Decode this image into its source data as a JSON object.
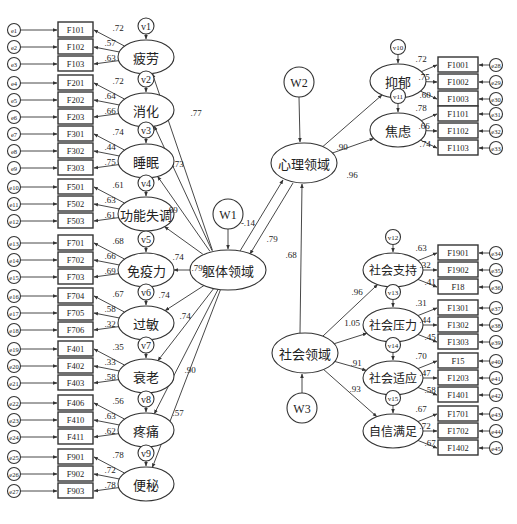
{
  "diagram": {
    "type": "structural-equation-model",
    "higher_order_factors": [
      {
        "id": "body",
        "label": "躯体领域",
        "disturbance": "W1"
      },
      {
        "id": "psych",
        "label": "心理领域",
        "disturbance": "W2"
      },
      {
        "id": "social",
        "label": "社会领域",
        "disturbance": "W3"
      }
    ],
    "structural_paths": [
      {
        "from": "body",
        "to": "psych",
        "value": "-.14"
      },
      {
        "from": "psych",
        "to": "body",
        "value": ".79"
      },
      {
        "from": "social",
        "to": "psych",
        "value": ".68"
      }
    ],
    "body_factors": [
      {
        "label": "疲劳",
        "disturbance": "v1",
        "loading": ".77",
        "items": [
          {
            "box": "F101",
            "err": "e1",
            "w": ".72"
          },
          {
            "box": "F102",
            "err": "e2",
            "w": ".57"
          },
          {
            "box": "F103",
            "err": "e3",
            "w": ".63"
          }
        ]
      },
      {
        "label": "消化",
        "disturbance": "v2",
        "loading": ".73",
        "items": [
          {
            "box": "F201",
            "err": "e4",
            "w": ".72"
          },
          {
            "box": "F202",
            "err": "e5",
            "w": ".64"
          },
          {
            "box": "F203",
            "err": "e6",
            "w": ".66"
          }
        ]
      },
      {
        "label": "睡眠",
        "disturbance": "v3",
        "loading": ".69",
        "items": [
          {
            "box": "F301",
            "err": "e7",
            "w": ".74"
          },
          {
            "box": "F302",
            "err": "e8",
            "w": ".44"
          },
          {
            "box": "F303",
            "err": "e9",
            "w": ".75"
          }
        ]
      },
      {
        "label": "功能失调",
        "disturbance": "v4",
        "loading": ".74",
        "items": [
          {
            "box": "F501",
            "err": "e10",
            "w": ".61"
          },
          {
            "box": "F502",
            "err": "e11",
            "w": ".63"
          },
          {
            "box": "F503",
            "err": "e12",
            "w": ".61"
          }
        ]
      },
      {
        "label": "免疫力",
        "disturbance": "v5",
        "loading": ".79",
        "items": [
          {
            "box": "F701",
            "err": "e13",
            "w": ".68"
          },
          {
            "box": "F702",
            "err": "e14",
            "w": ".66"
          },
          {
            "box": "F703",
            "err": "e15",
            "w": ".69"
          }
        ]
      },
      {
        "label": "过敏",
        "disturbance": "v6",
        "loading": ".74",
        "items": [
          {
            "box": "F704",
            "err": "e16",
            "w": ".67"
          },
          {
            "box": "F705",
            "err": "e17",
            "w": ".58"
          },
          {
            "box": "F706",
            "err": "e18",
            "w": ".32"
          }
        ]
      },
      {
        "label": "衰老",
        "disturbance": "v7",
        "loading": ".74",
        "items": [
          {
            "box": "F401",
            "err": "e19",
            "w": ".35"
          },
          {
            "box": "F402",
            "err": "e20",
            "w": ".33"
          },
          {
            "box": "F403",
            "err": "e21",
            "w": ".58"
          }
        ]
      },
      {
        "label": "疼痛",
        "disturbance": "v8",
        "loading": ".90",
        "items": [
          {
            "box": "F406",
            "err": "e22",
            "w": ".56"
          },
          {
            "box": "F410",
            "err": "e23",
            "w": ".63"
          },
          {
            "box": "F411",
            "err": "e24",
            "w": ".62"
          }
        ]
      },
      {
        "label": "便秘",
        "disturbance": "v9",
        "loading": ".57",
        "items": [
          {
            "box": "F901",
            "err": "e25",
            "w": ".78"
          },
          {
            "box": "F902",
            "err": "e26",
            "w": ".72"
          },
          {
            "box": "F903",
            "err": "e27",
            "w": ".78"
          }
        ]
      }
    ],
    "psych_factors": [
      {
        "label": "抑郁",
        "disturbance": "v10",
        "loading": ".90",
        "items": [
          {
            "box": "F1001",
            "err": "e28",
            "w": ".72"
          },
          {
            "box": "F1002",
            "err": "e29",
            "w": ".75"
          },
          {
            "box": "F1003",
            "err": "e30",
            "w": ".60"
          }
        ]
      },
      {
        "label": "焦虑",
        "disturbance": "v11",
        "loading": ".96",
        "items": [
          {
            "box": "F1101",
            "err": "e31",
            "w": ".78"
          },
          {
            "box": "F1102",
            "err": "e32",
            "w": ".66"
          },
          {
            "box": "F1103",
            "err": "e33",
            "w": ".74"
          }
        ]
      }
    ],
    "social_factors": [
      {
        "label": "社会支持",
        "disturbance": "v12",
        "loading": ".96",
        "items": [
          {
            "box": "F1901",
            "err": "e34",
            "w": ".63"
          },
          {
            "box": "F1902",
            "err": "e35",
            "w": ".32"
          },
          {
            "box": "F18",
            "err": "e36",
            "w": ".41"
          }
        ]
      },
      {
        "label": "社会压力",
        "disturbance": "v13",
        "loading": "1.05",
        "items": [
          {
            "box": "F1301",
            "err": "e37",
            "w": ".31"
          },
          {
            "box": "F1302",
            "err": "e38",
            "w": ".44"
          },
          {
            "box": "F1303",
            "err": "e39",
            "w": ".45"
          }
        ]
      },
      {
        "label": "社会适应",
        "disturbance": "v14",
        "loading": ".91",
        "items": [
          {
            "box": "F15",
            "err": "e40",
            "w": ".70"
          },
          {
            "box": "F1203",
            "err": "e41",
            "w": ".47"
          },
          {
            "box": "F1401",
            "err": "e42",
            "w": ".58"
          }
        ]
      },
      {
        "label": "自信满足",
        "disturbance": "v15",
        "loading": ".93",
        "items": [
          {
            "box": "F1701",
            "err": "e43",
            "w": ".67"
          },
          {
            "box": "F1702",
            "err": "e44",
            "w": ".72"
          },
          {
            "box": "F1402",
            "err": "e45",
            "w": ".67"
          }
        ]
      }
    ]
  }
}
